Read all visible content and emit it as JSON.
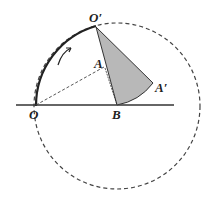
{
  "diagram": {
    "type": "geometry-rotation",
    "labels": {
      "O": "O",
      "O_prime": "O′",
      "A": "A",
      "A_prime": "A′",
      "B": "B"
    },
    "points": {
      "O": [
        36,
        105
      ],
      "B": [
        117,
        105
      ],
      "O_prime": [
        96,
        27
      ],
      "A": [
        104,
        67
      ],
      "A_prime": [
        153,
        83
      ]
    },
    "circle": {
      "center": "B",
      "radius": 82,
      "style": "dashed"
    },
    "colors": {
      "stroke": "#333333",
      "fill_sector": "#b8b8b8",
      "dashed": "#444444"
    },
    "rotation_arrow": "clockwise arrow near arc O→O′"
  }
}
